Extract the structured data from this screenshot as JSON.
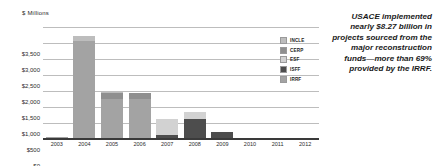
{
  "chart_data": {
    "type": "bar",
    "subtype": "stacked-bar",
    "title": "",
    "axis_title": "$ Millions",
    "xlabel": "",
    "ylabel": "$ Millions",
    "ylim": [
      0,
      3500
    ],
    "ytick_step": 500,
    "grid": true,
    "legend_position": "inside-right",
    "categories": [
      "2003",
      "2004",
      "2005",
      "2006",
      "2007",
      "2008",
      "2009",
      "2010",
      "2011",
      "2012"
    ],
    "ytick_labels": [
      "$0",
      "$500",
      "$1,000",
      "$1,500",
      "$2,000",
      "$2,500",
      "$3,000",
      "$3,500"
    ],
    "ytick_values": [
      0,
      500,
      1000,
      1500,
      2000,
      2500,
      3000,
      3500
    ],
    "series": [
      {
        "name": "IRRF",
        "color": "#a3a3a3",
        "values": [
          50,
          3060,
          1240,
          1240,
          0,
          0,
          0,
          0,
          0,
          0
        ]
      },
      {
        "name": "ISFF",
        "color": "#4d4d4d",
        "values": [
          0,
          0,
          0,
          0,
          140,
          610,
          205,
          0,
          0,
          0
        ]
      },
      {
        "name": "ESF",
        "color": "#d2d2d2",
        "values": [
          0,
          0,
          0,
          0,
          475,
          245,
          0,
          30,
          0,
          0
        ]
      },
      {
        "name": "CERP",
        "color": "#8f8f8f",
        "values": [
          0,
          0,
          195,
          185,
          0,
          0,
          0,
          0,
          0,
          0
        ]
      },
      {
        "name": "INCLE",
        "color": "#bdbdbd",
        "values": [
          0,
          160,
          75,
          0,
          0,
          0,
          0,
          0,
          0,
          0
        ]
      }
    ],
    "totals": [
      50,
      3220,
      1510,
      1425,
      615,
      855,
      205,
      30,
      0,
      0
    ]
  },
  "legend": {
    "items": [
      {
        "label": "INCLE",
        "color": "#bdbdbd"
      },
      {
        "label": "CERP",
        "color": "#8f8f8f"
      },
      {
        "label": "ESF",
        "color": "#d2d2d2"
      },
      {
        "label": "ISFF",
        "color": "#4d4d4d"
      },
      {
        "label": "IRRF",
        "color": "#a3a3a3"
      }
    ]
  },
  "callout": {
    "text": "USACE implemented nearly $8.27 billion in projects sourced from the major reconstruction funds—more than 69% provided by the IRRF."
  },
  "colors": {
    "gridline": "#bdbdbd",
    "axis": "#3a3a3a",
    "text": "#2b2b2b",
    "background": "#ffffff"
  }
}
